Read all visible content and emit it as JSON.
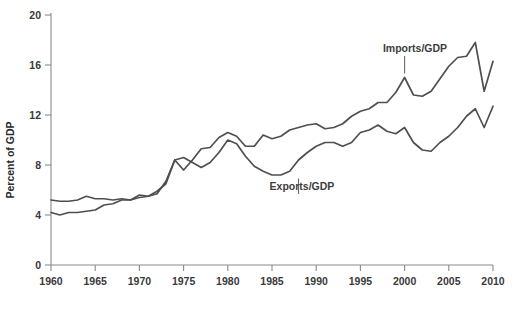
{
  "chart_data": {
    "type": "line",
    "title": "",
    "xlabel": "",
    "ylabel": "Percent of GDP",
    "xlim": [
      1960,
      2010
    ],
    "ylim": [
      0,
      20
    ],
    "grid": false,
    "legend_position": "inline-annotations",
    "x_ticks": [
      1960,
      1965,
      1970,
      1975,
      1980,
      1985,
      1990,
      1995,
      2000,
      2005,
      2010
    ],
    "y_ticks": [
      0,
      4,
      8,
      12,
      16,
      20
    ],
    "x": [
      1960,
      1961,
      1962,
      1963,
      1964,
      1965,
      1966,
      1967,
      1968,
      1969,
      1970,
      1971,
      1972,
      1973,
      1974,
      1975,
      1976,
      1977,
      1978,
      1979,
      1980,
      1981,
      1982,
      1983,
      1984,
      1985,
      1986,
      1987,
      1988,
      1989,
      1990,
      1991,
      1992,
      1993,
      1994,
      1995,
      1996,
      1997,
      1998,
      1999,
      2000,
      2001,
      2002,
      2003,
      2004,
      2005,
      2006,
      2007,
      2008,
      2009,
      2010
    ],
    "annotations": [
      {
        "text": "Imports/GDP",
        "year": 2000,
        "value": 15.0
      },
      {
        "text": "Exports/GDP",
        "year": 1988,
        "value": 6.6
      }
    ],
    "series": [
      {
        "name": "Imports/GDP",
        "label": "Imports/GDP",
        "color": "#4f4f4f",
        "values": [
          4.2,
          4.0,
          4.2,
          4.2,
          4.3,
          4.4,
          4.8,
          4.9,
          5.2,
          5.2,
          5.4,
          5.5,
          5.9,
          6.5,
          8.4,
          7.6,
          8.4,
          9.3,
          9.4,
          10.2,
          10.6,
          10.3,
          9.5,
          9.5,
          10.4,
          10.1,
          10.3,
          10.8,
          11.0,
          11.2,
          11.3,
          10.9,
          11.0,
          11.3,
          11.9,
          12.3,
          12.5,
          13.0,
          13.0,
          13.8,
          15.0,
          13.6,
          13.5,
          13.9,
          14.9,
          15.9,
          16.6,
          16.7,
          17.8,
          13.9,
          16.3
        ]
      },
      {
        "name": "Exports/GDP",
        "label": "Exports/GDP",
        "color": "#4f4f4f",
        "values": [
          5.2,
          5.1,
          5.1,
          5.2,
          5.5,
          5.3,
          5.3,
          5.2,
          5.3,
          5.2,
          5.6,
          5.5,
          5.7,
          6.7,
          8.4,
          8.6,
          8.2,
          7.8,
          8.2,
          9.0,
          10.0,
          9.7,
          8.7,
          7.9,
          7.5,
          7.2,
          7.2,
          7.5,
          8.4,
          9.0,
          9.5,
          9.8,
          9.8,
          9.5,
          9.8,
          10.6,
          10.8,
          11.2,
          10.7,
          10.5,
          11.0,
          9.8,
          9.2,
          9.1,
          9.8,
          10.3,
          11.0,
          11.9,
          12.5,
          11.0,
          12.7
        ]
      }
    ]
  },
  "axis": {
    "y_title": "Percent of GDP"
  }
}
